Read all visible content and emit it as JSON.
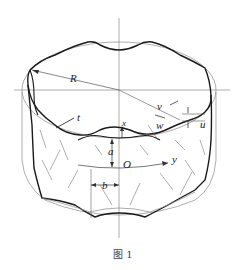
{
  "figure": {
    "caption": "图 1",
    "labels": {
      "R": "R",
      "v": "v",
      "w": "w",
      "u": "u",
      "t": "t",
      "x": "x",
      "a": "a",
      "O": "O",
      "y": "y",
      "b": "b"
    }
  },
  "colors": {
    "thick_line": "#1a1a1a",
    "thin_line": "#7a7a7a",
    "axis_line": "#8a8a8a",
    "background": "#ffffff"
  }
}
